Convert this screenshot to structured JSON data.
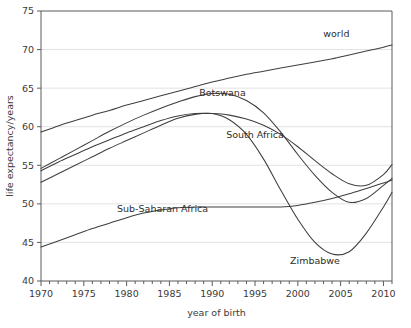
{
  "chart_data": {
    "type": "line",
    "title": "",
    "xlabel": "year of birth",
    "ylabel": "life expectancy/years",
    "xlim": [
      1970,
      2011
    ],
    "ylim": [
      40,
      75
    ],
    "xticks": [
      1970,
      1975,
      1980,
      1985,
      1990,
      1995,
      2000,
      2005,
      2010
    ],
    "xtick_labels": [
      "1970",
      "1975",
      "1980",
      "1985",
      "1990",
      "1995",
      "2000",
      "2005",
      "2010"
    ],
    "x_minor_tick_step": 1,
    "yticks": [
      40,
      45,
      50,
      55,
      60,
      65,
      70,
      75
    ],
    "ytick_labels": [
      "40",
      "45",
      "50",
      "55",
      "60",
      "65",
      "70",
      "75"
    ],
    "grid": "horizontal",
    "legend": "inline-labels",
    "line_color": "#3f3f3f",
    "grid_color": "#e2e2e2",
    "axis_color": "#5a5a5a",
    "x": [
      1970,
      1972,
      1974,
      1976,
      1978,
      1980,
      1982,
      1984,
      1986,
      1988,
      1990,
      1992,
      1994,
      1996,
      1998,
      2000,
      2002,
      2004,
      2006,
      2008,
      2010,
      2011
    ],
    "series": [
      {
        "name": "world",
        "label": "world",
        "label_x": 2004.5,
        "label_y": 71.6,
        "values": [
          59.3,
          60.1,
          60.8,
          61.5,
          62.1,
          62.8,
          63.4,
          64.0,
          64.6,
          65.2,
          65.8,
          66.3,
          66.8,
          67.2,
          67.6,
          68.0,
          68.4,
          68.8,
          69.3,
          69.8,
          70.3,
          70.6
        ]
      },
      {
        "name": "Botswana",
        "label": "Botswana",
        "label_x": 1991.2,
        "label_y": 64.0,
        "values": [
          54.6,
          55.8,
          57.0,
          58.2,
          59.4,
          60.5,
          61.5,
          62.4,
          63.2,
          63.9,
          64.3,
          64.2,
          63.4,
          61.8,
          59.3,
          56.4,
          53.7,
          51.5,
          50.2,
          50.7,
          52.4,
          53.3
        ]
      },
      {
        "name": "South Africa",
        "label": "South Africa",
        "label_x": 1995.0,
        "label_y": 58.6,
        "values": [
          54.3,
          55.4,
          56.4,
          57.4,
          58.3,
          59.2,
          60.0,
          60.8,
          61.4,
          61.7,
          61.7,
          61.5,
          61.0,
          60.2,
          59.0,
          57.4,
          55.6,
          53.9,
          52.6,
          52.4,
          53.8,
          55.1
        ]
      },
      {
        "name": "Sub-Saharan Africa",
        "label": "Sub-Saharan Africa",
        "label_x": 1984.2,
        "label_y": 49.0,
        "values": [
          44.4,
          45.2,
          46.0,
          46.8,
          47.5,
          48.2,
          48.8,
          49.2,
          49.5,
          49.6,
          49.6,
          49.6,
          49.6,
          49.6,
          49.6,
          49.8,
          50.2,
          50.7,
          51.3,
          52.0,
          52.7,
          53.1
        ]
      },
      {
        "name": "Zimbabwe",
        "label": "Zimbabwe",
        "label_x": 2002.0,
        "label_y": 42.2,
        "values": [
          52.8,
          53.9,
          55.0,
          56.1,
          57.2,
          58.2,
          59.2,
          60.2,
          61.1,
          61.6,
          61.7,
          60.9,
          59.0,
          55.8,
          51.8,
          48.0,
          45.0,
          43.5,
          43.8,
          46.2,
          49.6,
          51.5
        ]
      }
    ]
  }
}
